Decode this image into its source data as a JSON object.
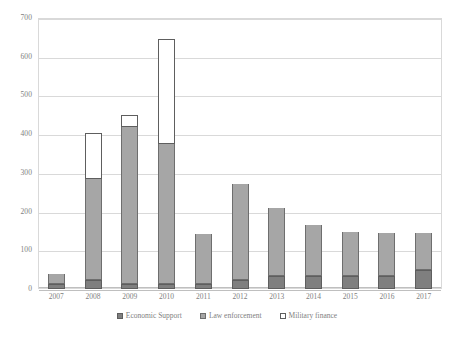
{
  "chart_data": {
    "type": "bar",
    "stacked": true,
    "title": "",
    "subtitle": "",
    "xlabel": "",
    "ylabel": "",
    "ylim": [
      0,
      700
    ],
    "ytick_step": 100,
    "yticks": [
      0,
      100,
      200,
      300,
      400,
      500,
      600,
      700
    ],
    "ytick_labels": [
      "0",
      "100",
      "200",
      "300",
      "400",
      "500",
      "600",
      "700"
    ],
    "grid": true,
    "grid_axis": "y",
    "legend_position": "bottom",
    "categories": [
      "2007",
      "2008",
      "2009",
      "2010",
      "2011",
      "2012",
      "2013",
      "2014",
      "2015",
      "2016",
      "2017"
    ],
    "series": [
      {
        "name": "Economic Support",
        "color": "#7f7f7f",
        "values": [
          13,
          22,
          13,
          13,
          13,
          22,
          33,
          33,
          33,
          33,
          50
        ]
      },
      {
        "name": "Law enforcement",
        "color": "#a6a6a6",
        "values": [
          27,
          262,
          405,
          362,
          130,
          250,
          175,
          133,
          115,
          112,
          95
        ]
      },
      {
        "name": "Military finance",
        "color": "#ffffff",
        "values": [
          0,
          118,
          32,
          270,
          0,
          0,
          0,
          0,
          0,
          0,
          0
        ]
      }
    ],
    "totals": [
      40,
      402,
      450,
      645,
      143,
      272,
      208,
      166,
      148,
      145,
      145
    ]
  },
  "legend": {
    "items": [
      {
        "label": "Economic Support",
        "swatch": "sw-econ"
      },
      {
        "label": "Law enforcement",
        "swatch": "sw-law"
      },
      {
        "label": "Military finance",
        "swatch": "sw-mil"
      }
    ]
  }
}
